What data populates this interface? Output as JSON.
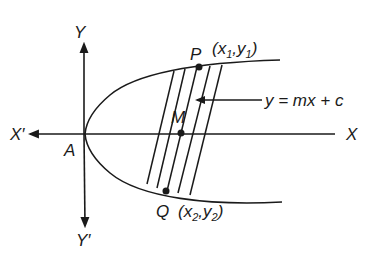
{
  "diagram": {
    "type": "parabola-chords",
    "axes": {
      "x_positive": "X",
      "x_negative": "X′",
      "y_positive": "Y",
      "y_negative": "Y′",
      "origin_label": "A"
    },
    "points": {
      "P": {
        "label": "P",
        "coords_label": "(x1, y1)",
        "x_sym": "x",
        "x_sub": "1",
        "y_sym": "y",
        "y_sub": "1"
      },
      "Q": {
        "label": "Q",
        "coords_label": "(x2, y2)",
        "x_sym": "x",
        "x_sub": "2",
        "y_sym": "y",
        "y_sub": "2"
      },
      "M": {
        "label": "M"
      }
    },
    "chord_equation": "y = mx + c",
    "num_parallel_chords": 5,
    "colors": {
      "stroke": "#1a1a1a",
      "background": "#ffffff"
    }
  }
}
